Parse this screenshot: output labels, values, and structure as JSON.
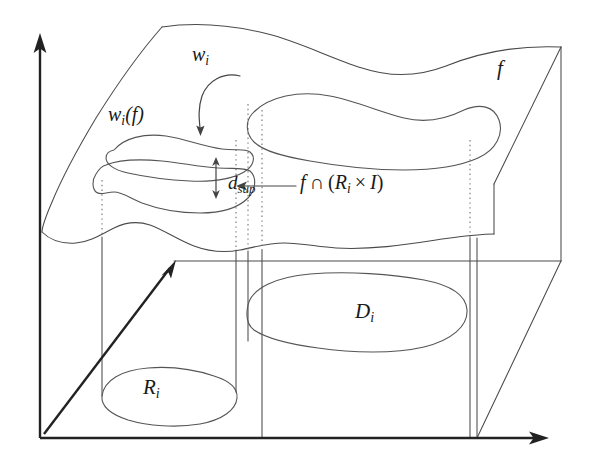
{
  "figure": {
    "kind": "mathematical-diagram",
    "background_color": "#ffffff",
    "stroke_color": "#4a4a4a",
    "axis_color": "#222222",
    "dotted_color": "#777777"
  },
  "labels": {
    "w_i": {
      "base": "w",
      "sub": "i",
      "text": "w_i"
    },
    "w_i_of_f": {
      "base": "w",
      "sub": "i",
      "paren_open": "(",
      "arg": "f",
      "paren_close": ")",
      "text": "w_i(f)"
    },
    "d_sup": {
      "base": "d",
      "sub": "sup",
      "text": "d_sup"
    },
    "f": {
      "base": "f",
      "text": "f"
    },
    "intersection": {
      "lhs": "f",
      "operator": "∩",
      "paren_open": "(",
      "set": "R",
      "set_sub": "i",
      "times": "×",
      "interval": "I",
      "paren_close": ")",
      "text": "f ∩ (R_i × I)"
    },
    "D_i": {
      "base": "D",
      "sub": "i",
      "text": "D_i"
    },
    "R_i": {
      "base": "R",
      "sub": "i",
      "text": "R_i"
    }
  },
  "axes": {
    "vertical": {
      "name": "vertical-axis",
      "from": [
        40,
        438
      ],
      "to": [
        40,
        40
      ],
      "arrowhead": "up"
    },
    "horizontal": {
      "name": "horizontal-axis",
      "from": [
        40,
        438
      ],
      "to": [
        548,
        438
      ],
      "arrowhead": "right"
    },
    "depth": {
      "name": "depth-axis",
      "from": [
        44,
        434
      ],
      "to": [
        174,
        262
      ],
      "arrowhead": "up-right"
    }
  },
  "annotation_arrows": [
    {
      "name": "w-i-pointer",
      "from": [
        236,
        78
      ],
      "to": [
        202,
        130
      ],
      "style": "curved"
    },
    {
      "name": "intersection-pointer",
      "from": [
        296,
        185
      ],
      "to": [
        236,
        185
      ],
      "style": "straight"
    },
    {
      "name": "d-sup-measure",
      "from": [
        216,
        160
      ],
      "to": [
        216,
        196
      ],
      "style": "double-headed"
    }
  ]
}
